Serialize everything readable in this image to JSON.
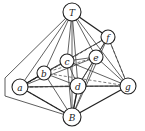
{
  "diagram": {
    "type": "graph",
    "nodes": [
      {
        "id": "T",
        "label": "T",
        "x": 72,
        "y": 12,
        "r": 9
      },
      {
        "id": "f",
        "label": "f",
        "x": 108,
        "y": 37,
        "r": 7
      },
      {
        "id": "e",
        "label": "e",
        "x": 96,
        "y": 57,
        "r": 7
      },
      {
        "id": "c",
        "label": "c",
        "x": 67,
        "y": 61,
        "r": 7
      },
      {
        "id": "b",
        "label": "b",
        "x": 44,
        "y": 73,
        "r": 7
      },
      {
        "id": "a",
        "label": "a",
        "x": 20,
        "y": 87,
        "r": 8
      },
      {
        "id": "d",
        "label": "d",
        "x": 78,
        "y": 86,
        "r": 8
      },
      {
        "id": "g",
        "label": "g",
        "x": 128,
        "y": 86,
        "r": 8
      },
      {
        "id": "B",
        "label": "B",
        "x": 72,
        "y": 117,
        "r": 9
      }
    ],
    "edges_solid": [
      [
        "T",
        "a"
      ],
      [
        "T",
        "b"
      ],
      [
        "T",
        "c"
      ],
      [
        "T",
        "d"
      ],
      [
        "T",
        "e"
      ],
      [
        "T",
        "g"
      ],
      [
        "T",
        "B"
      ],
      [
        "a",
        "b"
      ],
      [
        "a",
        "d"
      ],
      [
        "a",
        "e"
      ],
      [
        "a",
        "g"
      ],
      [
        "b",
        "c"
      ],
      [
        "b",
        "d"
      ],
      [
        "b",
        "f"
      ],
      [
        "b",
        "B"
      ],
      [
        "c",
        "e"
      ],
      [
        "c",
        "d"
      ],
      [
        "c",
        "g"
      ],
      [
        "c",
        "B"
      ],
      [
        "d",
        "e"
      ],
      [
        "d",
        "f"
      ],
      [
        "d",
        "g"
      ],
      [
        "d",
        "B"
      ],
      [
        "e",
        "f"
      ],
      [
        "e",
        "B"
      ],
      [
        "e",
        "g"
      ],
      [
        "f",
        "g"
      ],
      [
        "f",
        "B"
      ]
    ],
    "edges_bold": [
      [
        "T",
        "f"
      ],
      [
        "a",
        "B"
      ],
      [
        "g",
        "B"
      ],
      [
        "d",
        "B"
      ],
      [
        "a",
        "b"
      ]
    ],
    "edges_dashed": [
      [
        "a",
        "f"
      ],
      [
        "a",
        "c"
      ],
      [
        "a",
        "g"
      ],
      [
        "b",
        "e"
      ],
      [
        "b",
        "g"
      ],
      [
        "c",
        "f"
      ],
      [
        "a",
        "B"
      ],
      [
        "d",
        "a"
      ],
      [
        "f",
        "g"
      ]
    ],
    "outline": [
      [
        72,
        12
      ],
      [
        5,
        78
      ],
      [
        5,
        96
      ],
      [
        72,
        117
      ]
    ]
  }
}
